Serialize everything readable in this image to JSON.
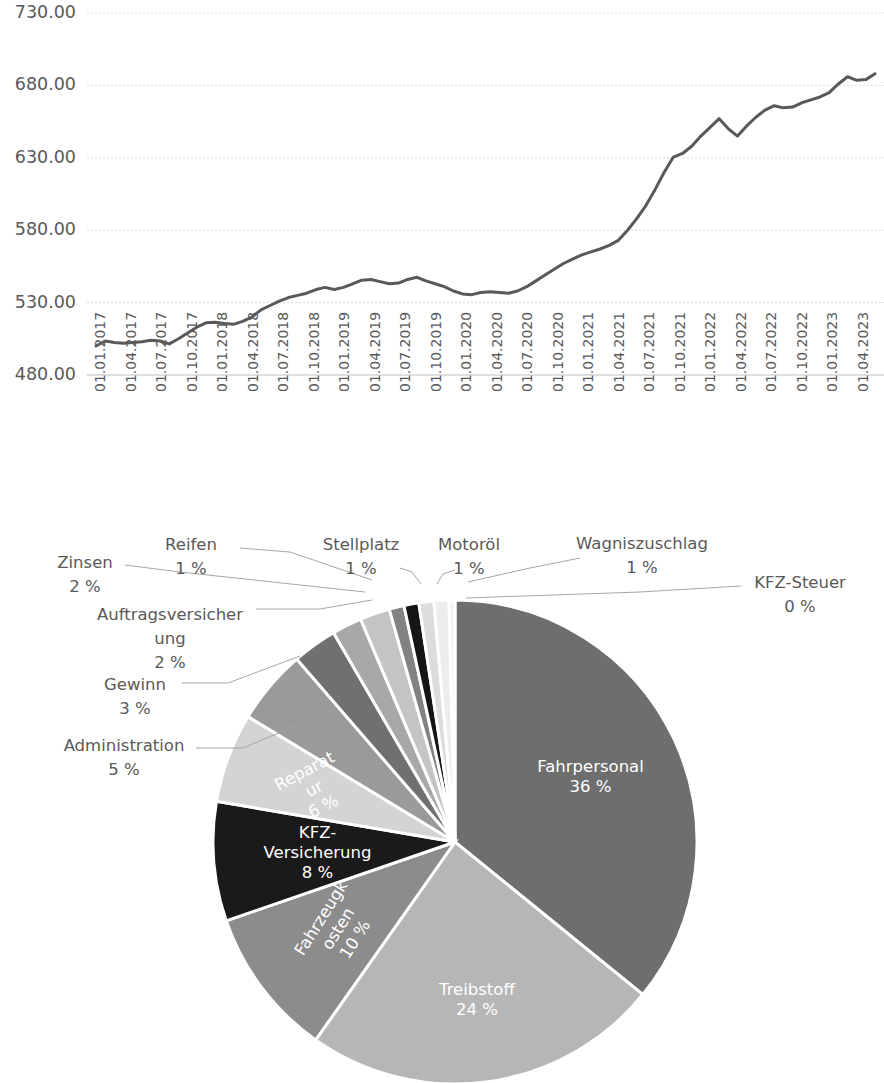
{
  "chart_data": [
    {
      "type": "line",
      "title": "",
      "subtitle": "",
      "xlabel": "",
      "ylabel": "",
      "grid": true,
      "legend": false,
      "ylim": [
        480,
        730
      ],
      "ytick_labels": [
        "730.00",
        "680.00",
        "630.00",
        "580.00",
        "530.00",
        "480.00"
      ],
      "ytick_values": [
        730,
        680,
        630,
        580,
        530,
        480
      ],
      "xtick_labels": [
        "01.01.2017",
        "01.04.2017",
        "01.07.2017",
        "01.10.2017",
        "01.01.2018",
        "01.04.2018",
        "01.07.2018",
        "01.10.2018",
        "01.01.2019",
        "01.04.2019",
        "01.07.2019",
        "01.10.2019",
        "01.01.2020",
        "01.04.2020",
        "01.07.2020",
        "01.10.2020",
        "01.01.2021",
        "01.04.2021",
        "01.07.2021",
        "01.10.2021",
        "01.01.2022",
        "01.04.2022",
        "01.07.2022",
        "01.10.2022",
        "01.01.2023",
        "01.04.2023"
      ],
      "series": [
        {
          "name": "Kostenindex",
          "color": "#595959",
          "values": [
            500.0,
            503.5,
            502.5,
            502.0,
            502.5,
            503.0,
            504.0,
            503.5,
            501.5,
            505.0,
            509.0,
            513.0,
            516.0,
            516.5,
            515.5,
            515.0,
            517.0,
            520.0,
            525.0,
            528.0,
            531.0,
            533.5,
            535.0,
            536.5,
            539.0,
            540.5,
            539.0,
            540.5,
            543.0,
            545.5,
            546.0,
            544.5,
            543.0,
            543.5,
            546.0,
            547.5,
            545.0,
            543.0,
            541.0,
            538.0,
            536.0,
            535.5,
            537.0,
            537.5,
            537.0,
            536.5,
            538.0,
            541.0,
            545.0,
            549.0,
            553.0,
            557.0,
            560.0,
            563.0,
            565.0,
            567.0,
            569.5,
            573.0,
            580.0,
            588.0,
            597.0,
            608.0,
            620.0,
            630.5,
            633.0,
            638.0,
            645.0,
            651.0,
            657.0,
            650.0,
            645.0,
            652.0,
            658.0,
            663.0,
            666.0,
            664.5,
            665.0,
            668.0,
            670.0,
            672.0,
            675.0,
            681.0,
            686.0,
            683.5,
            684.0,
            688.0
          ]
        }
      ]
    },
    {
      "type": "pie",
      "title": "",
      "start_angle_deg": -90,
      "direction": "clockwise",
      "labels": [
        "Fahrpersonal",
        "Treibstoff",
        "Fahrzeugkosten",
        "KFZ-Versicherung",
        "Reparatur",
        "Administration",
        "Gewinn",
        "Auftragsversicherung",
        "Zinsen",
        "Reifen",
        "Stellplatz",
        "Motoröl",
        "Wagniszuschlag",
        "KFZ-Steuer"
      ],
      "values": [
        36,
        24,
        10,
        8,
        6,
        5,
        3,
        2,
        2,
        1,
        1,
        1,
        1,
        0.4
      ],
      "percent_labels": [
        "36 %",
        "24 %",
        "10 %",
        "8 %",
        "6 %",
        "5 %",
        "3 %",
        "2 %",
        "2 %",
        "1 %",
        "1 %",
        "1 %",
        "1 %",
        "0 %"
      ],
      "colors": [
        "#6e6e6e",
        "#b6b6b6",
        "#8c8c8c",
        "#1a1a1a",
        "#d4d4d4",
        "#9a9a9a",
        "#707070",
        "#a8a8a8",
        "#c4c4c4",
        "#828282",
        "#151515",
        "#dcdcdc",
        "#ededed",
        "#f2f2f2"
      ],
      "label_placement": [
        "inside",
        "inside",
        "inside",
        "inside",
        "inside",
        "outside",
        "outside",
        "outside",
        "outside",
        "outside",
        "outside",
        "outside",
        "outside",
        "outside"
      ]
    }
  ],
  "line_chart": {
    "y_axis": {
      "ticks": [
        {
          "label": "730.00"
        },
        {
          "label": "680.00"
        },
        {
          "label": "630.00"
        },
        {
          "label": "580.00"
        },
        {
          "label": "530.00"
        },
        {
          "label": "480.00"
        }
      ]
    },
    "x_axis": {
      "ticks": [
        {
          "label": "01.01.2017"
        },
        {
          "label": "01.04.2017"
        },
        {
          "label": "01.07.2017"
        },
        {
          "label": "01.10.2017"
        },
        {
          "label": "01.01.2018"
        },
        {
          "label": "01.04.2018"
        },
        {
          "label": "01.07.2018"
        },
        {
          "label": "01.10.2018"
        },
        {
          "label": "01.01.2019"
        },
        {
          "label": "01.04.2019"
        },
        {
          "label": "01.07.2019"
        },
        {
          "label": "01.10.2019"
        },
        {
          "label": "01.01.2020"
        },
        {
          "label": "01.04.2020"
        },
        {
          "label": "01.07.2020"
        },
        {
          "label": "01.10.2020"
        },
        {
          "label": "01.01.2021"
        },
        {
          "label": "01.04.2021"
        },
        {
          "label": "01.07.2021"
        },
        {
          "label": "01.10.2021"
        },
        {
          "label": "01.01.2022"
        },
        {
          "label": "01.04.2022"
        },
        {
          "label": "01.07.2022"
        },
        {
          "label": "01.10.2022"
        },
        {
          "label": "01.01.2023"
        },
        {
          "label": "01.04.2023"
        }
      ]
    }
  },
  "pie_chart": {
    "slices": [
      {
        "name": "Fahrpersonal",
        "percent": "36 %",
        "value": 36
      },
      {
        "name": "Treibstoff",
        "percent": "24 %",
        "value": 24
      },
      {
        "name": "Fahrzeugkosten",
        "percent": "10 %",
        "value": 10
      },
      {
        "name": "KFZ-Versicherung",
        "percent": "8 %",
        "value": 8
      },
      {
        "name": "Reparatur",
        "percent": "6 %",
        "value": 6
      },
      {
        "name": "Administration",
        "percent": "5 %",
        "value": 5
      },
      {
        "name": "Gewinn",
        "percent": "3 %",
        "value": 3
      },
      {
        "name": "Auftragsversicherung",
        "percent": "2 %",
        "value": 2
      },
      {
        "name": "Zinsen",
        "percent": "2 %",
        "value": 2
      },
      {
        "name": "Reifen",
        "percent": "1 %",
        "value": 1
      },
      {
        "name": "Stellplatz",
        "percent": "1 %",
        "value": 1
      },
      {
        "name": "Motoröl",
        "percent": "1 %",
        "value": 1
      },
      {
        "name": "Wagniszuschlag",
        "percent": "1 %",
        "value": 1
      },
      {
        "name": "KFZ-Steuer",
        "percent": "0 %",
        "value": 0.4
      }
    ],
    "wrapped_labels": {
      "auftragsversicherung_line1": "Auftragsversicher",
      "auftragsversicherung_line2": "ung",
      "reparatur_line1": "Reparat",
      "reparatur_line2": "ur",
      "kfz_versicherung_line1": "KFZ-",
      "kfz_versicherung_line2": "Versicherung",
      "fahrzeugkosten_line1": "Fahrzeugk",
      "fahrzeugkosten_line2": "osten"
    }
  }
}
